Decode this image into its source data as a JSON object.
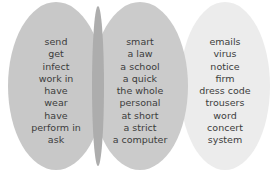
{
  "diagram": {
    "type": "word-matching-ovals",
    "colors": {
      "left": "#c8c8c8",
      "middle": "#cbcbcb",
      "right": "#ececec",
      "text": "#3c3c3c"
    },
    "columns": [
      {
        "name": "verbs",
        "words": [
          "send",
          "get",
          "infect",
          "work in",
          "have",
          "wear",
          "have",
          "perform in",
          "ask"
        ]
      },
      {
        "name": "modifiers",
        "words": [
          "smart",
          "a law",
          "a school",
          "a quick",
          "the whole",
          "personal",
          "at short",
          "a strict",
          "a computer"
        ]
      },
      {
        "name": "nouns",
        "words": [
          "emails",
          "virus",
          "notice",
          "firm",
          "dress code",
          "trousers",
          "word",
          "concert",
          "system"
        ]
      }
    ]
  }
}
